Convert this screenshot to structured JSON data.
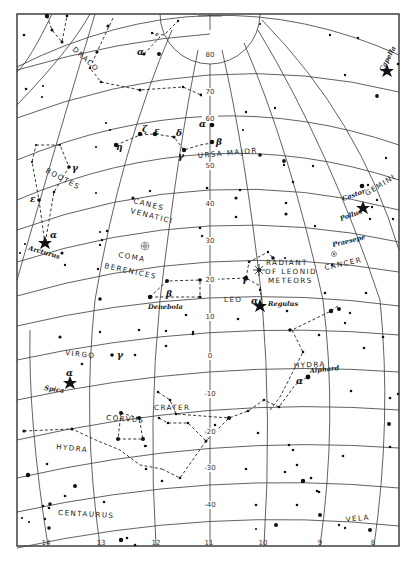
{
  "map": {
    "title": "Star chart: Leo and surrounding constellations",
    "declination_labels": [
      {
        "text": "80",
        "x": 210,
        "y": 57
      },
      {
        "text": "70",
        "x": 210,
        "y": 94
      },
      {
        "text": "60",
        "x": 210,
        "y": 121
      },
      {
        "text": "50",
        "x": 210,
        "y": 168
      },
      {
        "text": "40",
        "x": 210,
        "y": 206
      },
      {
        "text": "30",
        "x": 210,
        "y": 243
      },
      {
        "text": "20",
        "x": 210,
        "y": 282
      },
      {
        "text": "10",
        "x": 210,
        "y": 319
      },
      {
        "text": "0",
        "x": 210,
        "y": 358
      },
      {
        "text": "-10",
        "x": 210,
        "y": 396
      },
      {
        "text": "-20",
        "x": 210,
        "y": 434
      },
      {
        "text": "-30",
        "x": 210,
        "y": 470
      },
      {
        "text": "-40",
        "x": 210,
        "y": 507
      }
    ],
    "ra_labels": [
      {
        "text": "14",
        "x": 46,
        "y": 545
      },
      {
        "text": "13",
        "x": 101,
        "y": 545
      },
      {
        "text": "12",
        "x": 156,
        "y": 545
      },
      {
        "text": "11",
        "x": 209,
        "y": 545
      },
      {
        "text": "10",
        "x": 263,
        "y": 545
      },
      {
        "text": "9",
        "x": 320,
        "y": 545
      },
      {
        "text": "8",
        "x": 373,
        "y": 545
      }
    ],
    "constellations": [
      {
        "text": "DRACO",
        "x": 72,
        "y": 50,
        "rot": 42
      },
      {
        "text": "URSA MAJOR",
        "x": 198,
        "y": 158,
        "rot": -5
      },
      {
        "text": "BOOTES",
        "x": 45,
        "y": 172,
        "rot": 28
      },
      {
        "text": "CANES",
        "x": 133,
        "y": 203,
        "rot": 14
      },
      {
        "text": "VENATICI",
        "x": 130,
        "y": 213,
        "rot": 14
      },
      {
        "text": "COMA",
        "x": 118,
        "y": 257,
        "rot": 10
      },
      {
        "text": "BERENICES",
        "x": 104,
        "y": 268,
        "rot": 12
      },
      {
        "text": "LEO",
        "x": 224,
        "y": 302,
        "rot": 0
      },
      {
        "text": "CANCER",
        "x": 325,
        "y": 270,
        "rot": -12
      },
      {
        "text": "GEMINI",
        "x": 367,
        "y": 196,
        "rot": -32
      },
      {
        "text": "VIRGO",
        "x": 65,
        "y": 355,
        "rot": 6
      },
      {
        "text": "HYDRA",
        "x": 294,
        "y": 368,
        "rot": -3
      },
      {
        "text": "CRATER",
        "x": 154,
        "y": 410,
        "rot": 0
      },
      {
        "text": "CORVUS",
        "x": 106,
        "y": 420,
        "rot": 4
      },
      {
        "text": "HYDRA",
        "x": 56,
        "y": 449,
        "rot": 6
      },
      {
        "text": "CENTAURUS",
        "x": 58,
        "y": 515,
        "rot": 3
      },
      {
        "text": "VELA",
        "x": 346,
        "y": 522,
        "rot": -6
      }
    ],
    "radiant_label": [
      {
        "text": "RADIANT",
        "x": 266,
        "y": 265
      },
      {
        "text": "OF LEONID",
        "x": 265,
        "y": 274
      },
      {
        "text": "METEORS",
        "x": 268,
        "y": 283
      }
    ],
    "star_names": [
      {
        "text": "Capella",
        "x": 383,
        "y": 72,
        "rot": -62
      },
      {
        "text": "Castor",
        "x": 343,
        "y": 201,
        "rot": -20
      },
      {
        "text": "Pollux",
        "x": 341,
        "y": 221,
        "rot": -20
      },
      {
        "text": "Praesepe",
        "x": 333,
        "y": 247,
        "rot": -14
      },
      {
        "text": "Arcturus",
        "x": 28,
        "y": 250,
        "rot": 16
      },
      {
        "text": "Denebola",
        "x": 148,
        "y": 309,
        "rot": 0
      },
      {
        "text": "Regulus",
        "x": 268,
        "y": 306,
        "rot": 0
      },
      {
        "text": "Alphard",
        "x": 310,
        "y": 373,
        "rot": -6
      },
      {
        "text": "Spica",
        "x": 44,
        "y": 390,
        "rot": 8
      }
    ],
    "greek": [
      {
        "text": "α",
        "x": 199,
        "y": 127
      },
      {
        "text": "β",
        "x": 216,
        "y": 145
      },
      {
        "text": "γ",
        "x": 178,
        "y": 159
      },
      {
        "text": "δ",
        "x": 176,
        "y": 136
      },
      {
        "text": "ε",
        "x": 154,
        "y": 134
      },
      {
        "text": "ζ",
        "x": 142,
        "y": 132
      },
      {
        "text": "η",
        "x": 116,
        "y": 150
      },
      {
        "text": "α",
        "x": 137,
        "y": 55
      },
      {
        "text": "γ",
        "x": 72,
        "y": 171
      },
      {
        "text": "ε",
        "x": 30,
        "y": 202
      },
      {
        "text": "α",
        "x": 50,
        "y": 238
      },
      {
        "text": "β",
        "x": 166,
        "y": 297
      },
      {
        "text": "γ",
        "x": 242,
        "y": 282
      },
      {
        "text": "α",
        "x": 251,
        "y": 304
      },
      {
        "text": "α",
        "x": 66,
        "y": 376
      },
      {
        "text": "γ",
        "x": 117,
        "y": 358
      },
      {
        "text": "α",
        "x": 296,
        "y": 384
      }
    ],
    "colors": {
      "ink": "#111111",
      "grid": "#3a3a3a",
      "paper": "#ffffff"
    }
  }
}
